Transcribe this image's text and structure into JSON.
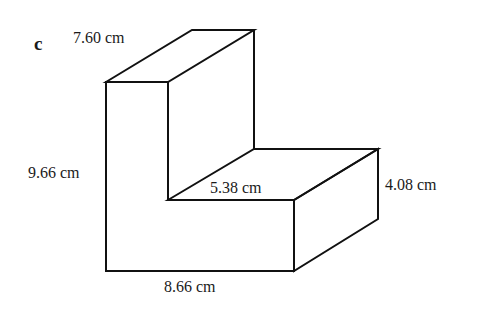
{
  "diagram": {
    "part_label": "c",
    "stroke_color": "#111111",
    "background": "#ffffff",
    "labels": {
      "top_depth": "7.60 cm",
      "total_height": "9.66 cm",
      "step_depth": "5.38 cm",
      "step_height": "4.08 cm",
      "total_width": "8.66 cm"
    },
    "vertices": {
      "front_outline": [
        [
          106,
          82
        ],
        [
          168,
          82
        ],
        [
          168,
          200
        ],
        [
          294,
          200
        ],
        [
          294,
          271
        ],
        [
          106,
          271
        ]
      ],
      "top_face": [
        [
          106,
          82
        ],
        [
          192,
          30
        ],
        [
          254,
          30
        ],
        [
          168,
          82
        ]
      ],
      "upper_back_right_edge": [
        [
          254,
          30
        ],
        [
          254,
          149
        ]
      ],
      "step_top_face": [
        [
          168,
          200
        ],
        [
          254,
          149
        ],
        [
          378,
          149
        ],
        [
          294,
          200
        ]
      ],
      "step_side_face": [
        [
          294,
          200
        ],
        [
          378,
          149
        ],
        [
          378,
          219
        ],
        [
          294,
          271
        ]
      ]
    }
  }
}
